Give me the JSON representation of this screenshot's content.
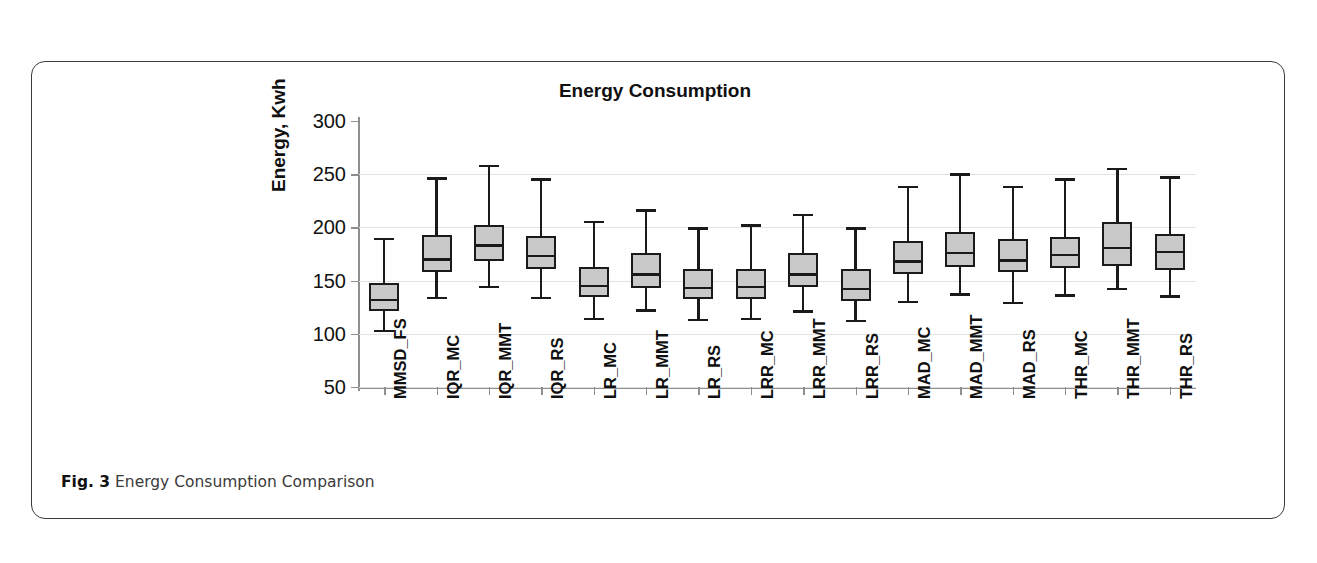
{
  "figure": {
    "caption_prefix": "Fig. 3",
    "caption_text": "Energy Consumption Comparison"
  },
  "chart_data": {
    "type": "box",
    "title": "Energy Consumption",
    "xlabel": "",
    "ylabel": "Energy, Kwh",
    "ylim": [
      50,
      300
    ],
    "yticks": [
      50,
      100,
      150,
      200,
      250,
      300
    ],
    "grid": true,
    "legend": null,
    "box_fill_color": "#c9c9c9",
    "box_line_color": "#1a1a1a",
    "categories": [
      "MMSD_FS",
      "IQR_MC",
      "IQR_MMT",
      "IQR_RS",
      "LR_MC",
      "LR_MMT",
      "LR_RS",
      "LRR_MC",
      "LRR_MMT",
      "LRR_RS",
      "MAD_MC",
      "MAD_MMT",
      "MAD_RS",
      "THR_MC",
      "THR_MMT",
      "THR_RS"
    ],
    "boxes": [
      {
        "category": "MMSD_FS",
        "whisker_low": 104,
        "q1": 121,
        "median": 133,
        "q3": 148,
        "whisker_high": 190
      },
      {
        "category": "IQR_MC",
        "whisker_low": 135,
        "q1": 158,
        "median": 171,
        "q3": 193,
        "whisker_high": 247
      },
      {
        "category": "IQR_MMT",
        "whisker_low": 145,
        "q1": 168,
        "median": 184,
        "q3": 202,
        "whisker_high": 259
      },
      {
        "category": "IQR_RS",
        "whisker_low": 135,
        "q1": 161,
        "median": 174,
        "q3": 192,
        "whisker_high": 246
      },
      {
        "category": "LR_MC",
        "whisker_low": 115,
        "q1": 135,
        "median": 146,
        "q3": 163,
        "whisker_high": 206
      },
      {
        "category": "LR_MMT",
        "whisker_low": 123,
        "q1": 143,
        "median": 157,
        "q3": 176,
        "whisker_high": 217
      },
      {
        "category": "LR_RS",
        "whisker_low": 114,
        "q1": 133,
        "median": 144,
        "q3": 161,
        "whisker_high": 200
      },
      {
        "category": "LRR_MC",
        "whisker_low": 115,
        "q1": 133,
        "median": 145,
        "q3": 161,
        "whisker_high": 203
      },
      {
        "category": "LRR_MMT",
        "whisker_low": 122,
        "q1": 144,
        "median": 157,
        "q3": 176,
        "whisker_high": 213
      },
      {
        "category": "LRR_RS",
        "whisker_low": 113,
        "q1": 131,
        "median": 143,
        "q3": 161,
        "whisker_high": 200
      },
      {
        "category": "MAD_MC",
        "whisker_low": 131,
        "q1": 156,
        "median": 169,
        "q3": 187,
        "whisker_high": 239
      },
      {
        "category": "MAD_MMT",
        "whisker_low": 138,
        "q1": 163,
        "median": 177,
        "q3": 196,
        "whisker_high": 251
      },
      {
        "category": "MAD_RS",
        "whisker_low": 130,
        "q1": 158,
        "median": 170,
        "q3": 189,
        "whisker_high": 239
      },
      {
        "category": "THR_MC",
        "whisker_low": 137,
        "q1": 162,
        "median": 175,
        "q3": 191,
        "whisker_high": 246
      },
      {
        "category": "THR_MMT",
        "whisker_low": 143,
        "q1": 164,
        "median": 182,
        "q3": 205,
        "whisker_high": 256
      },
      {
        "category": "THR_RS",
        "whisker_low": 136,
        "q1": 160,
        "median": 178,
        "q3": 194,
        "whisker_high": 248
      }
    ]
  }
}
